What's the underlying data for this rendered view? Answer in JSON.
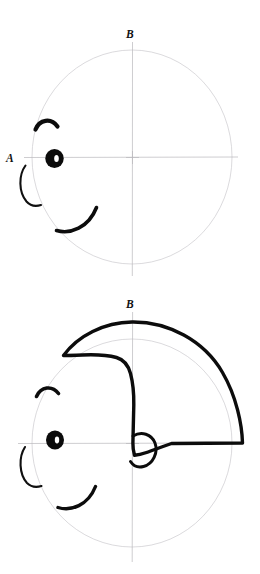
{
  "canvas": {
    "width": 260,
    "height": 574,
    "background": "#ffffff",
    "ink_color": "#0c0c0c",
    "guide_color": "#bcbabe"
  },
  "figures": [
    {
      "id": "figure-top",
      "caption_top": "B",
      "caption_left": "A",
      "circle": {
        "cx": 132,
        "cy": 157,
        "rx": 100,
        "ry": 107
      },
      "crosshair": {
        "cx": 132,
        "cy": 157,
        "v_top": 42,
        "v_bottom": 276,
        "h_left": 24,
        "h_right": 238
      },
      "parts": [
        "head-outline-circle",
        "vertical-axis",
        "horizontal-axis",
        "center-cross-mark",
        "eyebrow",
        "eye",
        "nose",
        "mouth"
      ]
    },
    {
      "id": "figure-bottom",
      "caption_top": "B",
      "circle": {
        "cx": 132,
        "cy": 443,
        "rx": 100,
        "ry": 104
      },
      "crosshair": {
        "cx": 132,
        "cy": 443,
        "v_top": 312,
        "v_bottom": 562,
        "h_left": 18,
        "h_right": 240
      },
      "parts": [
        "head-outline-circle",
        "vertical-axis",
        "horizontal-axis",
        "center-cross-mark",
        "eyebrow",
        "eye",
        "nose",
        "mouth",
        "ear",
        "helmet-hair-outline"
      ]
    }
  ],
  "labels": {
    "top_axis_letter": "B",
    "left_side_letter": "A",
    "bottom_axis_letter": "B"
  }
}
